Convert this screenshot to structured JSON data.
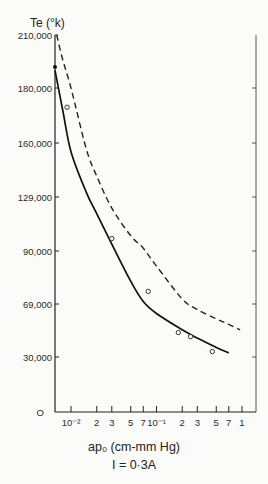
{
  "chart_data": {
    "type": "line",
    "title": "",
    "ylabel": "Te (°k)",
    "xlabel": "ap₀ (cm-mm Hg)",
    "caption": "I = 0·3A",
    "xscale": "log",
    "xlim": [
      0.0065,
      1.0
    ],
    "ylim": [
      0,
      210000
    ],
    "grid": false,
    "y_ticks": [
      {
        "value": 210000,
        "label": "210,000"
      },
      {
        "value": 180000,
        "label": "180,000"
      },
      {
        "value": 160000,
        "label": "160,000"
      },
      {
        "value": 129000,
        "label": "129,000"
      },
      {
        "value": 90000,
        "label": "90,000"
      },
      {
        "value": 69000,
        "label": "69,000"
      },
      {
        "value": 30000,
        "label": "30,000"
      },
      {
        "value": 0,
        "label": "O"
      }
    ],
    "x_ticks": [
      {
        "value": 0.01,
        "label": "10⁻²"
      },
      {
        "value": 0.02,
        "label": "2"
      },
      {
        "value": 0.03,
        "label": "3"
      },
      {
        "value": 0.05,
        "label": "5"
      },
      {
        "value": 0.07,
        "label": "7"
      },
      {
        "value": 0.1,
        "label": "10⁻¹"
      },
      {
        "value": 0.2,
        "label": "2"
      },
      {
        "value": 0.3,
        "label": "3"
      },
      {
        "value": 0.5,
        "label": "5"
      },
      {
        "value": 0.7,
        "label": "7"
      },
      {
        "value": 1.0,
        "label": "1"
      }
    ],
    "series": [
      {
        "name": "theory (solid)",
        "style": "solid",
        "x": [
          0.0065,
          0.008,
          0.01,
          0.015,
          0.02,
          0.03,
          0.05,
          0.07,
          0.1,
          0.2,
          0.3,
          0.5,
          0.7
        ],
        "y": [
          190000,
          172000,
          155000,
          132000,
          117000,
          95000,
          78000,
          70000,
          62000,
          50000,
          44000,
          37000,
          33000
        ]
      },
      {
        "name": "theory (dashed)",
        "style": "dashed",
        "x": [
          0.0068,
          0.008,
          0.01,
          0.015,
          0.02,
          0.03,
          0.05,
          0.07,
          0.1,
          0.2,
          0.3,
          0.5,
          0.7,
          0.95
        ],
        "y": [
          210000,
          196000,
          180000,
          157000,
          141000,
          121000,
          101000,
          92000,
          84000,
          71000,
          65000,
          58000,
          54000,
          50000
        ]
      },
      {
        "name": "experimental points",
        "style": "markers",
        "x": [
          0.009,
          0.03,
          0.08,
          0.18,
          0.25,
          0.45
        ],
        "y": [
          173000,
          99000,
          74000,
          48000,
          45000,
          34000
        ]
      }
    ]
  }
}
